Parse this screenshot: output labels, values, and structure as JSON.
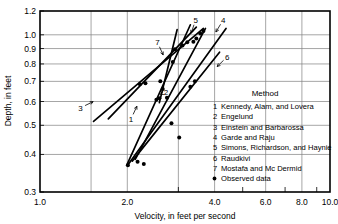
{
  "chart_data": {
    "type": "line",
    "title": "",
    "xlabel": "Velocity, in feet per second",
    "ylabel": "Depth, in feet",
    "xscale": "log",
    "yscale": "log",
    "xlim": [
      1.0,
      10.0
    ],
    "ylim": [
      0.3,
      1.2
    ],
    "xticks": [
      1.0,
      2.0,
      4.0,
      6.0,
      8.0,
      10.0
    ],
    "xtick_labels": [
      "1.0",
      "2.0",
      "4.0",
      "6.0",
      "8.0",
      "10.0"
    ],
    "yticks": [
      0.3,
      0.4,
      0.5,
      0.6,
      0.7,
      0.8,
      0.9,
      1.0,
      1.2
    ],
    "ytick_labels": [
      "0.3",
      "0.4",
      "0.5",
      "0.6",
      "0.7",
      "0.8",
      "0.9",
      "1.0",
      "1.2"
    ],
    "grid": true,
    "legend_position": "lower-right-inside",
    "legend_title": "Method",
    "series": [
      {
        "id": "1",
        "name": "Kennedy, Alam, and Lovera",
        "label_text": "1",
        "label_x": 2.06,
        "label_y": 0.525,
        "points": [
          [
            1.72,
            0.525
          ],
          [
            3.46,
            1.06
          ]
        ]
      },
      {
        "id": "2",
        "name": "Engelund",
        "label_text": "2",
        "label_x": 2.72,
        "label_y": 0.645,
        "points": [
          [
            1.99,
            0.368
          ],
          [
            3.3,
            1.08
          ]
        ]
      },
      {
        "id": "3",
        "name": "Einstein and Barbarossa",
        "label_text": "3",
        "label_x": 1.38,
        "label_y": 0.572,
        "points": [
          [
            1.53,
            0.515
          ],
          [
            3.66,
            1.05
          ]
        ]
      },
      {
        "id": "4",
        "name": "Garde and Raju",
        "label_text": "4",
        "label_x": 4.28,
        "label_y": 1.12,
        "points": [
          [
            2.02,
            0.372
          ],
          [
            4.38,
            1.05
          ]
        ]
      },
      {
        "id": "5",
        "name": "Simons, Richardson, and Haynie",
        "label_text": "5",
        "label_x": 3.44,
        "label_y": 1.12,
        "points": [
          [
            2.13,
            0.385
          ],
          [
            3.72,
            1.05
          ]
        ]
      },
      {
        "id": "6",
        "name": "Raudkivi",
        "label_text": "6",
        "label_x": 4.42,
        "label_y": 0.845,
        "points": [
          [
            2.08,
            0.38
          ],
          [
            4.16,
            0.875
          ]
        ]
      },
      {
        "id": "7",
        "name": "Mostafa and Mc Dermid",
        "label_text": "7",
        "label_x": 2.54,
        "label_y": 0.945,
        "points": [
          [
            2.58,
            0.595
          ],
          [
            2.97,
            1.04
          ]
        ]
      }
    ],
    "observed_data_label": "Observed data",
    "observed_points": [
      [
        2.21,
        0.685
      ],
      [
        2.31,
        0.69
      ],
      [
        2.6,
        0.7
      ],
      [
        2.58,
        0.615
      ],
      [
        2.52,
        0.608
      ],
      [
        2.74,
        0.618
      ],
      [
        2.87,
        0.812
      ],
      [
        2.92,
        0.896
      ],
      [
        3.1,
        0.922
      ],
      [
        3.22,
        0.945
      ],
      [
        3.38,
        0.948
      ],
      [
        3.3,
        0.672
      ],
      [
        3.42,
        0.7
      ],
      [
        3.46,
        0.972
      ],
      [
        3.57,
        1.01
      ],
      [
        3.66,
        1.03
      ],
      [
        2.84,
        0.508
      ],
      [
        3.02,
        0.455
      ],
      [
        2.28,
        0.372
      ],
      [
        2.01,
        0.368
      ],
      [
        2.17,
        0.378
      ],
      [
        2.65,
        0.66
      ]
    ],
    "legend_entries": [
      {
        "key": "1",
        "label": "Kennedy, Alam, and Lovera"
      },
      {
        "key": "2",
        "label": "Engelund"
      },
      {
        "key": "3",
        "label": "Einstein and Barbarossa"
      },
      {
        "key": "4",
        "label": "Garde and Raju"
      },
      {
        "key": "5",
        "label": "Simons, Richardson, and Haynie"
      },
      {
        "key": "6",
        "label": "Raudkivi"
      },
      {
        "key": "7",
        "label": "Mostafa and Mc Dermid"
      },
      {
        "key": "dot",
        "label": "Observed data"
      }
    ],
    "colors": {
      "line": "#000000",
      "grid": "#808080",
      "frame": "#000000",
      "marker": "#000000",
      "background": "#ffffff"
    }
  }
}
